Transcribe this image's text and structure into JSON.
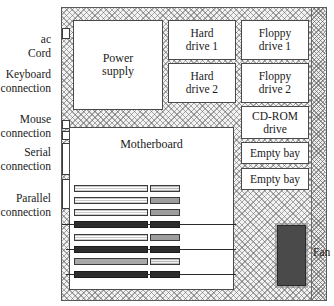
{
  "figure": {
    "colors": {
      "case_fill": "#f2f2f2",
      "case_hatch": "#5a5a5a",
      "box_fill": "#ffffff",
      "box_border": "#4a4a4a",
      "fan_fill": "#4a4a4a",
      "slot_dark": "#2e2e2e",
      "text": "#1a1a1a"
    }
  },
  "case": {
    "name": "computer-case",
    "rail_label": ""
  },
  "components": {
    "power_supply": "Power\nsupply",
    "hard_drive_1": "Hard\ndrive 1",
    "hard_drive_2": "Hard\ndrive 2",
    "floppy_drive_1": "Floppy\ndrive 1",
    "floppy_drive_2": "Floppy\ndrive 2",
    "cdrom_drive": "CD-ROM\ndrive",
    "empty_bay_1": "Empty bay",
    "empty_bay_2": "Empty bay",
    "motherboard": "Motherboard",
    "fan": "Fan"
  },
  "connections": {
    "ac_cord": "ac\nCord",
    "keyboard": "Keyboard\nconnection",
    "mouse": "Mouse\nconnection",
    "serial": "Serial\nconnection",
    "parallel": "Parallel\nconnection"
  },
  "slots": [
    {
      "index": 1,
      "style": "light",
      "lead": false
    },
    {
      "index": 2,
      "style": "light",
      "lead": false
    },
    {
      "index": 3,
      "style": "light",
      "lead": false
    },
    {
      "index": 4,
      "style": "dark",
      "lead": true
    },
    {
      "index": 5,
      "style": "light",
      "lead": false
    },
    {
      "index": 6,
      "style": "dark",
      "lead": true
    },
    {
      "index": 7,
      "style": "mid",
      "lead": false
    },
    {
      "index": 8,
      "style": "dark",
      "lead": true
    }
  ]
}
